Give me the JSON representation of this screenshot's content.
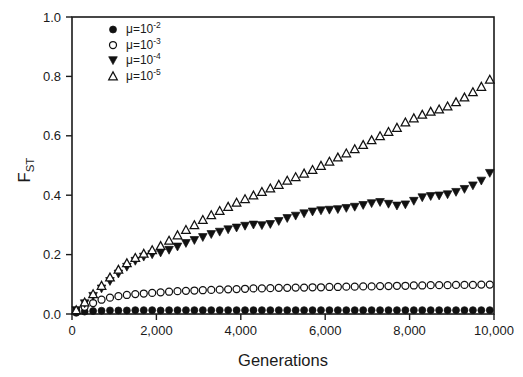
{
  "chart_data": {
    "type": "scatter",
    "title": "",
    "xlabel": "Generations",
    "ylabel": "FST",
    "ylabel_base": "F",
    "ylabel_sub": "ST",
    "xlim": [
      0,
      10000
    ],
    "ylim": [
      0,
      1.0
    ],
    "xticks": [
      0,
      2000,
      4000,
      6000,
      8000,
      10000
    ],
    "xticklabels": [
      "0",
      "2,000",
      "4,000",
      "6,000",
      "8,000",
      "10,000"
    ],
    "yticks": [
      0.0,
      0.2,
      0.4,
      0.6,
      0.8,
      1.0
    ],
    "yticklabels": [
      "0.0",
      "0.2",
      "0.4",
      "0.6",
      "0.8",
      "1.0"
    ],
    "grid": false,
    "legend_position": "top-left",
    "marker_color": "#111111",
    "axis_color": "#1a1a1a",
    "background": "#ffffff",
    "series": [
      {
        "name": "mu=10-2",
        "legend_base": "μ=10",
        "legend_sup": "-2",
        "marker": "filled-circle",
        "x": [
          100,
          300,
          500,
          700,
          900,
          1100,
          1300,
          1500,
          1700,
          1900,
          2100,
          2300,
          2500,
          2700,
          2900,
          3100,
          3300,
          3500,
          3700,
          3900,
          4100,
          4300,
          4500,
          4700,
          4900,
          5100,
          5300,
          5500,
          5700,
          5900,
          6100,
          6300,
          6500,
          6700,
          6900,
          7100,
          7300,
          7500,
          7700,
          7900,
          8100,
          8300,
          8500,
          8700,
          8900,
          9100,
          9300,
          9500,
          9700,
          9900
        ],
        "values": [
          0.004,
          0.008,
          0.01,
          0.011,
          0.012,
          0.012,
          0.012,
          0.013,
          0.013,
          0.013,
          0.012,
          0.013,
          0.013,
          0.013,
          0.013,
          0.013,
          0.013,
          0.013,
          0.013,
          0.013,
          0.013,
          0.013,
          0.013,
          0.013,
          0.013,
          0.013,
          0.013,
          0.013,
          0.013,
          0.013,
          0.013,
          0.013,
          0.013,
          0.013,
          0.013,
          0.013,
          0.013,
          0.013,
          0.013,
          0.013,
          0.013,
          0.013,
          0.013,
          0.013,
          0.013,
          0.013,
          0.013,
          0.013,
          0.013,
          0.013
        ]
      },
      {
        "name": "mu=10-3",
        "legend_base": "μ=10",
        "legend_sup": "-3",
        "marker": "open-circle",
        "x": [
          100,
          300,
          500,
          700,
          900,
          1100,
          1300,
          1500,
          1700,
          1900,
          2100,
          2300,
          2500,
          2700,
          2900,
          3100,
          3300,
          3500,
          3700,
          3900,
          4100,
          4300,
          4500,
          4700,
          4900,
          5100,
          5300,
          5500,
          5700,
          5900,
          6100,
          6300,
          6500,
          6700,
          6900,
          7100,
          7300,
          7500,
          7700,
          7900,
          8100,
          8300,
          8500,
          8700,
          8900,
          9100,
          9300,
          9500,
          9700,
          9900
        ],
        "values": [
          0.01,
          0.024,
          0.037,
          0.048,
          0.055,
          0.06,
          0.064,
          0.067,
          0.069,
          0.071,
          0.073,
          0.075,
          0.077,
          0.078,
          0.079,
          0.08,
          0.081,
          0.082,
          0.083,
          0.084,
          0.085,
          0.086,
          0.086,
          0.087,
          0.088,
          0.088,
          0.089,
          0.089,
          0.09,
          0.09,
          0.091,
          0.091,
          0.092,
          0.092,
          0.093,
          0.093,
          0.094,
          0.094,
          0.095,
          0.095,
          0.096,
          0.096,
          0.097,
          0.097,
          0.097,
          0.098,
          0.098,
          0.098,
          0.099,
          0.099
        ]
      },
      {
        "name": "mu=10-4",
        "legend_base": "μ=10",
        "legend_sup": "-4",
        "marker": "filled-down-triangle",
        "x": [
          100,
          300,
          500,
          700,
          900,
          1100,
          1300,
          1500,
          1700,
          1900,
          2100,
          2300,
          2500,
          2700,
          2900,
          3100,
          3300,
          3500,
          3700,
          3900,
          4100,
          4300,
          4500,
          4700,
          4900,
          5100,
          5300,
          5500,
          5700,
          5900,
          6100,
          6300,
          6500,
          6700,
          6900,
          7100,
          7300,
          7500,
          7700,
          7900,
          8100,
          8300,
          8500,
          8700,
          8900,
          9100,
          9300,
          9500,
          9700,
          9900
        ],
        "values": [
          0.012,
          0.035,
          0.06,
          0.085,
          0.11,
          0.135,
          0.158,
          0.178,
          0.192,
          0.2,
          0.206,
          0.215,
          0.226,
          0.238,
          0.248,
          0.258,
          0.268,
          0.276,
          0.284,
          0.29,
          0.296,
          0.3,
          0.298,
          0.302,
          0.312,
          0.322,
          0.33,
          0.338,
          0.344,
          0.348,
          0.35,
          0.352,
          0.356,
          0.36,
          0.366,
          0.372,
          0.376,
          0.37,
          0.364,
          0.368,
          0.38,
          0.392,
          0.396,
          0.398,
          0.402,
          0.41,
          0.42,
          0.432,
          0.448,
          0.474
        ]
      },
      {
        "name": "mu=10-5",
        "legend_base": "μ=10",
        "legend_sup": "-5",
        "marker": "open-up-triangle",
        "x": [
          100,
          300,
          500,
          700,
          900,
          1100,
          1300,
          1500,
          1700,
          1900,
          2100,
          2300,
          2500,
          2700,
          2900,
          3100,
          3300,
          3500,
          3700,
          3900,
          4100,
          4300,
          4500,
          4700,
          4900,
          5100,
          5300,
          5500,
          5700,
          5900,
          6100,
          6300,
          6500,
          6700,
          6900,
          7100,
          7300,
          7500,
          7700,
          7900,
          8100,
          8300,
          8500,
          8700,
          8900,
          9100,
          9300,
          9500,
          9700,
          9900
        ],
        "values": [
          0.014,
          0.04,
          0.068,
          0.096,
          0.124,
          0.15,
          0.172,
          0.19,
          0.204,
          0.216,
          0.23,
          0.248,
          0.266,
          0.284,
          0.3,
          0.318,
          0.334,
          0.348,
          0.362,
          0.376,
          0.388,
          0.4,
          0.412,
          0.424,
          0.436,
          0.45,
          0.462,
          0.474,
          0.486,
          0.5,
          0.514,
          0.528,
          0.542,
          0.556,
          0.57,
          0.586,
          0.6,
          0.614,
          0.628,
          0.646,
          0.66,
          0.672,
          0.682,
          0.69,
          0.7,
          0.714,
          0.73,
          0.748,
          0.766,
          0.79
        ]
      }
    ]
  }
}
